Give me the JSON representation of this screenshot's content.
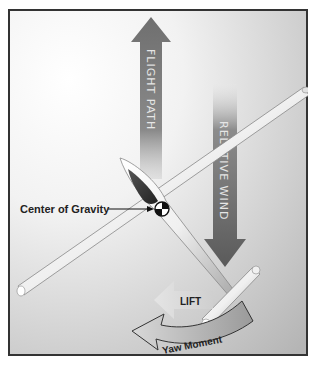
{
  "diagram": {
    "labels": {
      "flight_path": "FLIGHT PATH",
      "relative_wind": "RELATIVE WIND",
      "center_of_gravity": "Center of Gravity",
      "lift": "LIFT",
      "yaw_moment": "Yaw Moment"
    },
    "colors": {
      "frame_border": "#333333",
      "background_light": "#ffffff",
      "background_dark": "#b9b9b9",
      "flight_path_arrow": "#7a7a7a",
      "relative_wind_arrow": "#6a6a6a",
      "lift_arrow": "#d4d4d4",
      "yaw_arrow": "#8c8c8c",
      "canopy": "#3a3a3a",
      "airframe": "#f4f4f4"
    }
  }
}
